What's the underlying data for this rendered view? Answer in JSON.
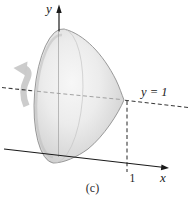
{
  "figure": {
    "caption": "(c)",
    "y_axis_label": "y",
    "x_axis_label": "x",
    "rotation_axis_label": "y = 1",
    "x_tick_label": "1",
    "colors": {
      "axis": "#1a1a1a",
      "dashed_line": "#3a3a3a",
      "interior_dashed": "#9a9a9a",
      "interior_axis": "#9e9e9e",
      "solid_outline": "#8f8f8f",
      "solid_fill_light": "#f7f7f7",
      "solid_fill_dark": "#bfbfbf",
      "rotation_arrow": "#c9c9c9",
      "background": "#ffffff"
    }
  }
}
